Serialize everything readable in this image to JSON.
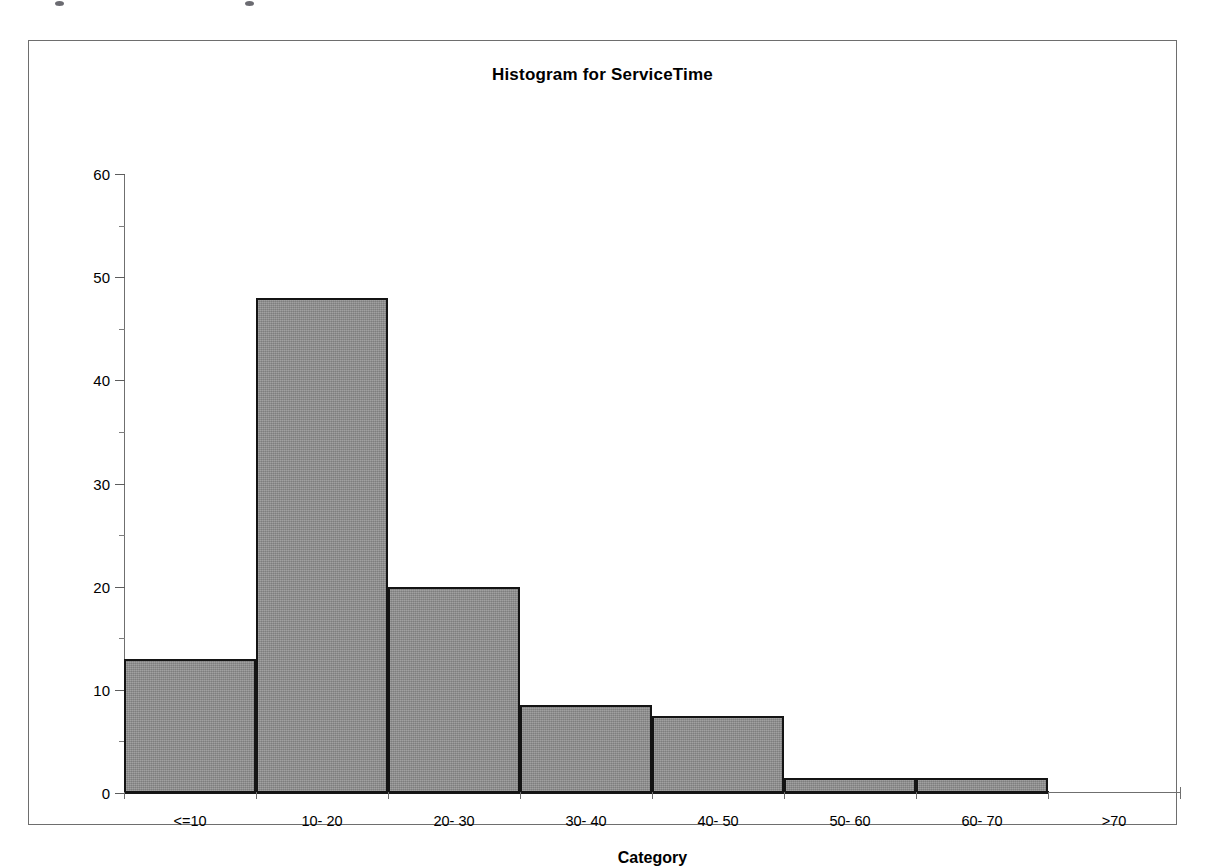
{
  "chart_data": {
    "type": "bar",
    "title": "Histogram for ServiceTime",
    "xlabel": "Category",
    "ylabel": "",
    "categories": [
      "<=10",
      "10- 20",
      "20- 30",
      "30- 40",
      "40- 50",
      "50- 60",
      "60- 70",
      ">70"
    ],
    "values": [
      13,
      48,
      20,
      8.5,
      7.5,
      1.5,
      1.5,
      0
    ],
    "ylim": [
      0,
      60
    ],
    "ytick_labels": [
      "0",
      "10",
      "20",
      "30",
      "40",
      "50",
      "60"
    ],
    "ytick_values": [
      0,
      10,
      20,
      30,
      40,
      50,
      60
    ],
    "ytick_minor_values": [
      5,
      15,
      25,
      35,
      45,
      55
    ],
    "grid": false,
    "legend": null,
    "bar_fill_color": "#8d8d8d",
    "bar_edge_color": "#141414",
    "axis_color": "#6f6f6f",
    "frame_color": "#6e6e6e"
  }
}
